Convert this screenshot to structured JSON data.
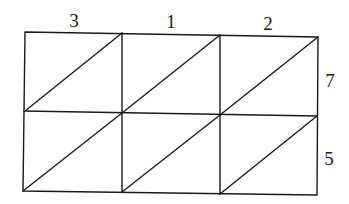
{
  "diagram": {
    "type": "lattice-multiplication-grid",
    "top_digits": [
      "3",
      "1",
      "2"
    ],
    "right_digits": [
      "7",
      "5"
    ],
    "rows": 2,
    "columns": 3,
    "line_color": "#1a1a1a"
  }
}
